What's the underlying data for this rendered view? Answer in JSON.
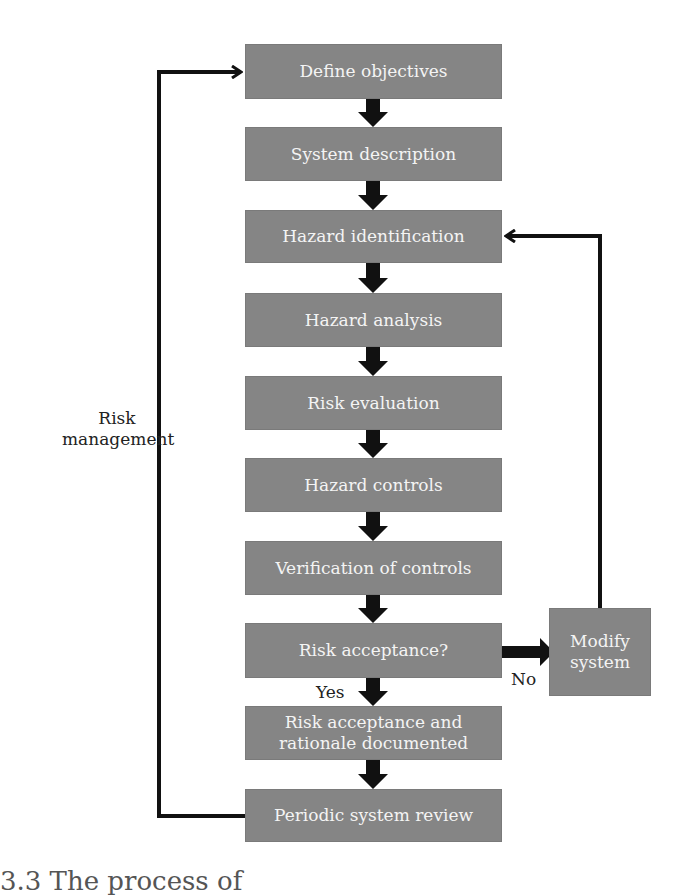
{
  "diagram": {
    "type": "flowchart",
    "steps": [
      {
        "id": "define-objectives",
        "label": "Define objectives"
      },
      {
        "id": "system-description",
        "label": "System description"
      },
      {
        "id": "hazard-identification",
        "label": "Hazard identification"
      },
      {
        "id": "hazard-analysis",
        "label": "Hazard analysis"
      },
      {
        "id": "risk-evaluation",
        "label": "Risk evaluation"
      },
      {
        "id": "hazard-controls",
        "label": "Hazard controls"
      },
      {
        "id": "verification-of-controls",
        "label": "Verification of controls"
      },
      {
        "id": "risk-acceptance",
        "label": "Risk acceptance?"
      },
      {
        "id": "risk-acceptance-documented",
        "label": "Risk acceptance and rationale documented"
      },
      {
        "id": "periodic-system-review",
        "label": "Periodic system review"
      }
    ],
    "side_box": {
      "id": "modify-system",
      "label": "Modify system"
    },
    "edge_labels": {
      "yes": "Yes",
      "no": "No",
      "loop": "Risk management"
    },
    "loop_label_lines": [
      "Risk",
      "management"
    ],
    "modify_label_lines": [
      "Modify",
      "system"
    ],
    "documented_label_lines": [
      "Risk acceptance and",
      "rationale documented"
    ],
    "caption_fragment": "3.3   The process of"
  },
  "colors": {
    "box_fill": "#858585",
    "box_text": "#f4f4f4",
    "arrow": "#111111",
    "background": "#ffffff"
  }
}
